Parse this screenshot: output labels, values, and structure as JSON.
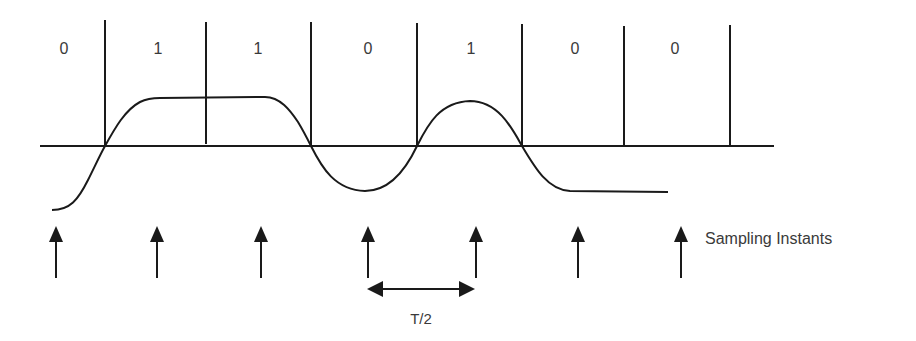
{
  "diagram": {
    "bits": [
      "0",
      "1",
      "1",
      "0",
      "1",
      "0",
      "0"
    ],
    "sampling_label": "Sampling Instants",
    "period_label": "T/2",
    "colors": {
      "line": "#1a1a1a",
      "text": "#3a3a3a",
      "background": "#ffffff"
    }
  }
}
